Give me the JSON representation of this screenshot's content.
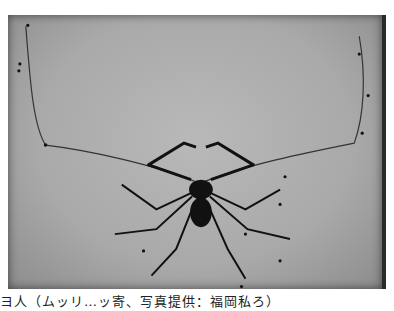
{
  "photo": {
    "subject": "whip-spider-specimen",
    "background_color": "#a9a9a9",
    "specimen_color": "#111111"
  },
  "caption": {
    "text": "ヨ人（ムッリ…ッ寄、写真提供：福岡私ろ）"
  }
}
